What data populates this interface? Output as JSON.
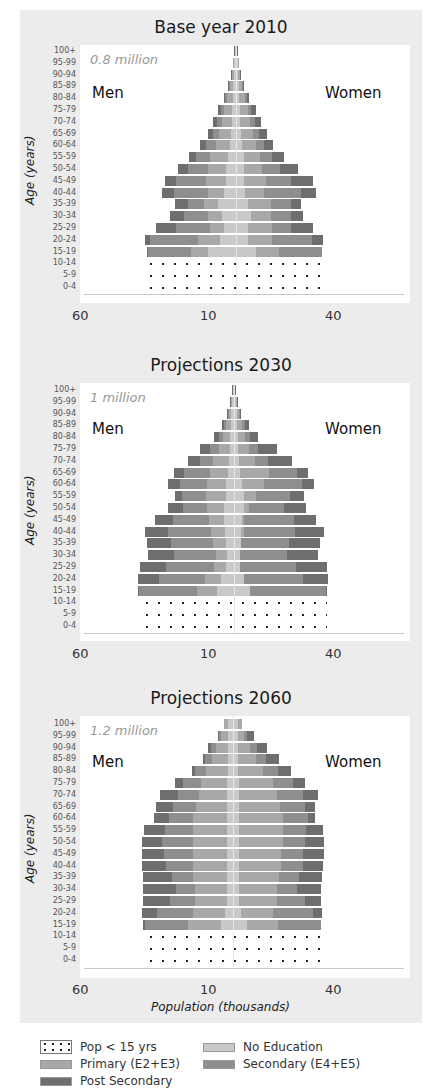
{
  "colors": {
    "panel_bg": "#ececec",
    "no_education": "#c9c9c9",
    "primary": "#a8a8a8",
    "secondary": "#8e8e8e",
    "post_secondary": "#6e6e6e",
    "dots": "#222222"
  },
  "xaxis": {
    "title": "Population (thousands)",
    "ticks": [
      "60",
      "10",
      "40"
    ]
  },
  "yaxis": {
    "title": "Age (years)",
    "ticks": [
      "100+",
      "95-99",
      "90-94",
      "85-89",
      "80-84",
      "75-79",
      "70-74",
      "65-69",
      "60-64",
      "55-59",
      "50-54",
      "45-49",
      "40-44",
      "35-39",
      "30-34",
      "25-29",
      "20-24",
      "15-19",
      "10-14",
      "5-9",
      "0-4"
    ]
  },
  "legend": [
    {
      "key": "under15",
      "label": "Pop < 15 yrs"
    },
    {
      "key": "no_education",
      "label": "No Education"
    },
    {
      "key": "primary",
      "label": "Primary (E2+E3)"
    },
    {
      "key": "secondary",
      "label": "Secondary (E4+E5)"
    },
    {
      "key": "post_secondary",
      "label": "Post Secondary"
    }
  ],
  "chart_data": [
    {
      "type": "bar",
      "subtype": "population-pyramid",
      "title": "Base year 2010",
      "total_label": "0.8 million",
      "left_label": "Men",
      "right_label": "Women",
      "xlabel": "Population (thousands)",
      "ylabel": "Age (years)",
      "x_tick_labels": [
        "60",
        "10",
        "40"
      ],
      "series_order": [
        "No Education",
        "Primary (E2+E3)",
        "Secondary (E4+E5)",
        "Post Secondary"
      ],
      "note": "Values are approximate half-widths in px from center axis, cumulative segment edges [none, primary, secondary, post] for men (m) and women (w); rows ordered from 100+ down to 15-19. Ages 0-14 shown as dotted block.",
      "rows": [
        {
          "age": "100+",
          "m": [
            1,
            1,
            1,
            2
          ],
          "w": [
            1,
            1,
            1,
            2
          ]
        },
        {
          "age": "95-99",
          "m": [
            2,
            3,
            3,
            3
          ],
          "w": [
            2,
            3,
            3,
            3
          ]
        },
        {
          "age": "90-94",
          "m": [
            2,
            4,
            4,
            5
          ],
          "w": [
            2,
            4,
            4,
            5
          ]
        },
        {
          "age": "85-89",
          "m": [
            3,
            6,
            7,
            8
          ],
          "w": [
            3,
            6,
            7,
            8
          ]
        },
        {
          "age": "80-84",
          "m": [
            3,
            9,
            11,
            12
          ],
          "w": [
            3,
            9,
            11,
            13
          ]
        },
        {
          "age": "75-79",
          "m": [
            4,
            12,
            15,
            18
          ],
          "w": [
            4,
            12,
            15,
            20
          ]
        },
        {
          "age": "70-74",
          "m": [
            4,
            14,
            19,
            23
          ],
          "w": [
            4,
            14,
            19,
            25
          ]
        },
        {
          "age": "65-69",
          "m": [
            5,
            17,
            23,
            28
          ],
          "w": [
            5,
            17,
            23,
            31
          ]
        },
        {
          "age": "60-64",
          "m": [
            6,
            20,
            30,
            36
          ],
          "w": [
            6,
            20,
            28,
            37
          ]
        },
        {
          "age": "55-59",
          "m": [
            8,
            26,
            40,
            47
          ],
          "w": [
            8,
            24,
            36,
            48
          ]
        },
        {
          "age": "50-54",
          "m": [
            10,
            28,
            48,
            58
          ],
          "w": [
            8,
            26,
            44,
            62
          ]
        },
        {
          "age": "45-49",
          "m": [
            10,
            30,
            60,
            71
          ],
          "w": [
            8,
            30,
            55,
            77
          ]
        },
        {
          "age": "40-44",
          "m": [
            12,
            28,
            62,
            74
          ],
          "w": [
            9,
            28,
            65,
            80
          ]
        },
        {
          "age": "35-39",
          "m": [
            18,
            32,
            48,
            61
          ],
          "w": [
            12,
            35,
            55,
            65
          ]
        },
        {
          "age": "30-34",
          "m": [
            14,
            28,
            52,
            66
          ],
          "w": [
            15,
            35,
            55,
            67
          ]
        },
        {
          "age": "25-29",
          "m": [
            12,
            26,
            60,
            80
          ],
          "w": [
            12,
            36,
            55,
            77
          ]
        },
        {
          "age": "20-24",
          "m": [
            16,
            38,
            86,
            91
          ],
          "w": [
            12,
            36,
            76,
            87
          ]
        },
        {
          "age": "15-19",
          "m": [
            28,
            45,
            88,
            89
          ],
          "w": [
            20,
            43,
            86,
            86
          ]
        }
      ],
      "under15": {
        "m": 91,
        "w": 91
      }
    },
    {
      "type": "bar",
      "subtype": "population-pyramid",
      "title": "Projections 2030",
      "total_label": "1 million",
      "left_label": "Men",
      "right_label": "Women",
      "xlabel": "Population (thousands)",
      "ylabel": "Age (years)",
      "x_tick_labels": [
        "60",
        "10",
        "40"
      ],
      "rows": [
        {
          "age": "100+",
          "m": [
            1,
            1,
            1,
            2
          ],
          "w": [
            1,
            1,
            1,
            2
          ]
        },
        {
          "age": "95-99",
          "m": [
            2,
            3,
            3,
            4
          ],
          "w": [
            2,
            3,
            3,
            4
          ]
        },
        {
          "age": "90-94",
          "m": [
            3,
            5,
            6,
            7
          ],
          "w": [
            3,
            5,
            6,
            7
          ]
        },
        {
          "age": "85-89",
          "m": [
            3,
            8,
            10,
            12
          ],
          "w": [
            3,
            8,
            11,
            15
          ]
        },
        {
          "age": "80-84",
          "m": [
            4,
            11,
            15,
            20
          ],
          "w": [
            4,
            11,
            16,
            24
          ]
        },
        {
          "age": "75-79",
          "m": [
            4,
            15,
            24,
            34
          ],
          "w": [
            4,
            15,
            24,
            43
          ]
        },
        {
          "age": "70-74",
          "m": [
            5,
            21,
            34,
            46
          ],
          "w": [
            5,
            21,
            34,
            58
          ]
        },
        {
          "age": "65-69",
          "m": [
            6,
            24,
            50,
            60
          ],
          "w": [
            6,
            35,
            63,
            74
          ]
        },
        {
          "age": "60-64",
          "m": [
            8,
            27,
            54,
            66
          ],
          "w": [
            8,
            30,
            68,
            80
          ]
        },
        {
          "age": "55-59",
          "m": [
            8,
            28,
            52,
            59
          ],
          "w": [
            10,
            22,
            56,
            70
          ]
        },
        {
          "age": "50-54",
          "m": [
            10,
            27,
            51,
            66
          ],
          "w": [
            10,
            15,
            50,
            72
          ]
        },
        {
          "age": "45-49",
          "m": [
            10,
            25,
            61,
            79
          ],
          "w": [
            8,
            10,
            60,
            82
          ]
        },
        {
          "age": "40-44",
          "m": [
            9,
            23,
            66,
            89
          ],
          "w": [
            7,
            10,
            61,
            90
          ]
        },
        {
          "age": "35-39",
          "m": [
            8,
            21,
            63,
            87
          ],
          "w": [
            7,
            5,
            55,
            86
          ]
        },
        {
          "age": "30-34",
          "m": [
            7,
            18,
            60,
            86
          ],
          "w": [
            6,
            3,
            53,
            84
          ]
        },
        {
          "age": "25-29",
          "m": [
            8,
            20,
            68,
            94
          ],
          "w": [
            6,
            3,
            62,
            93
          ]
        },
        {
          "age": "20-24",
          "m": [
            13,
            29,
            75,
            96
          ],
          "w": [
            10,
            10,
            69,
            94
          ]
        },
        {
          "age": "15-19",
          "m": [
            17,
            37,
            95,
            96
          ],
          "w": [
            16,
            16,
            92,
            93
          ]
        }
      ],
      "under15": {
        "m": 93,
        "w": 93
      }
    },
    {
      "type": "bar",
      "subtype": "population-pyramid",
      "title": "Projections 2060",
      "total_label": "1.2 million",
      "left_label": "Men",
      "right_label": "Women",
      "xlabel": "Population (thousands)",
      "ylabel": "Age (years)",
      "x_tick_labels": [
        "60",
        "10",
        "40"
      ],
      "rows": [
        {
          "age": "100+",
          "m": [
            5,
            9,
            9,
            9
          ],
          "w": [
            5,
            9,
            9,
            9
          ]
        },
        {
          "age": "95-99",
          "m": [
            5,
            12,
            14,
            15
          ],
          "w": [
            5,
            11,
            14,
            21
          ]
        },
        {
          "age": "90-94",
          "m": [
            5,
            17,
            22,
            25
          ],
          "w": [
            5,
            17,
            24,
            34
          ]
        },
        {
          "age": "85-89",
          "m": [
            5,
            21,
            28,
            30
          ],
          "w": [
            5,
            23,
            33,
            46
          ]
        },
        {
          "age": "80-84",
          "m": [
            5,
            27,
            38,
            41
          ],
          "w": [
            5,
            30,
            45,
            58
          ]
        },
        {
          "age": "75-79",
          "m": [
            6,
            32,
            50,
            58
          ],
          "w": [
            6,
            40,
            60,
            72
          ]
        },
        {
          "age": "70-74",
          "m": [
            6,
            34,
            55,
            73
          ],
          "w": [
            6,
            44,
            70,
            85
          ]
        },
        {
          "age": "65-69",
          "m": [
            6,
            37,
            60,
            77
          ],
          "w": [
            6,
            47,
            72,
            82
          ]
        },
        {
          "age": "60-64",
          "m": [
            6,
            40,
            64,
            79
          ],
          "w": [
            6,
            50,
            75,
            82
          ]
        },
        {
          "age": "55-59",
          "m": [
            6,
            40,
            68,
            89
          ],
          "w": [
            6,
            50,
            73,
            90
          ]
        },
        {
          "age": "50-54",
          "m": [
            6,
            40,
            71,
            91
          ],
          "w": [
            6,
            50,
            72,
            91
          ]
        },
        {
          "age": "45-49",
          "m": [
            6,
            40,
            69,
            91
          ],
          "w": [
            6,
            48,
            70,
            91
          ]
        },
        {
          "age": "40-44",
          "m": [
            6,
            40,
            67,
            91
          ],
          "w": [
            6,
            48,
            70,
            90
          ]
        },
        {
          "age": "35-39",
          "m": [
            6,
            40,
            61,
            90
          ],
          "w": [
            6,
            46,
            66,
            89
          ]
        },
        {
          "age": "30-34",
          "m": [
            6,
            38,
            57,
            90
          ],
          "w": [
            6,
            44,
            64,
            88
          ]
        },
        {
          "age": "25-29",
          "m": [
            6,
            38,
            63,
            90
          ],
          "w": [
            6,
            44,
            72,
            88
          ]
        },
        {
          "age": "20-24",
          "m": [
            8,
            40,
            76,
            91
          ],
          "w": [
            8,
            40,
            80,
            89
          ]
        },
        {
          "age": "15-19",
          "m": [
            12,
            45,
            88,
            90
          ],
          "w": [
            14,
            45,
            88,
            88
          ]
        }
      ],
      "under15": {
        "m": 88,
        "w": 88
      }
    }
  ]
}
